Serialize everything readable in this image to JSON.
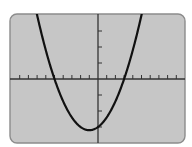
{
  "display": {
    "label": "Graphing calculator screen",
    "screen_fill": "#c6c6c6",
    "screen_border": "#8c8c8c",
    "axis_color": "#333333",
    "curve_color": "#111111",
    "background": "#ffffff"
  },
  "chart_data": {
    "type": "line",
    "title": "",
    "xlabel": "",
    "ylabel": "",
    "function": "y = x^2 + 2x - 15",
    "window": {
      "xmin": -10,
      "xmax": 9.8,
      "xscl": 1,
      "ymin": -20,
      "ymax": 20,
      "yscl": 5
    },
    "grid": false,
    "legend": null,
    "x_intercepts": [
      -5,
      3
    ],
    "y_intercept": -15,
    "vertex": [
      -1,
      -16
    ],
    "x_ticks": [
      -9,
      -8,
      -7,
      -6,
      -5,
      -4,
      -3,
      -2,
      -1,
      1,
      2,
      3,
      4,
      5,
      6,
      7,
      8,
      9
    ],
    "y_ticks": [
      -15,
      -10,
      -5,
      5,
      10,
      15
    ],
    "points": [
      [
        -7.2,
        22.44
      ],
      [
        -7,
        20
      ],
      [
        -6,
        9
      ],
      [
        -5,
        0
      ],
      [
        -4,
        -7
      ],
      [
        -3,
        -12
      ],
      [
        -2,
        -15
      ],
      [
        -1,
        -16
      ],
      [
        0,
        -15
      ],
      [
        1,
        -12
      ],
      [
        2,
        -7
      ],
      [
        3,
        0
      ],
      [
        4,
        9
      ],
      [
        5,
        20
      ],
      [
        5.1,
        21.21
      ]
    ]
  }
}
